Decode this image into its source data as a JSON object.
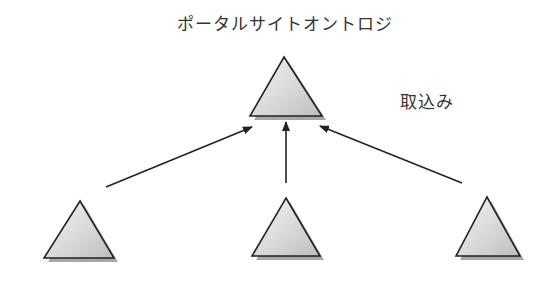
{
  "diagram": {
    "title": "ポータルサイトオントロジ",
    "edge_label": "取込み",
    "colors": {
      "stroke": "#222222",
      "fill_light": "#f2f2f2",
      "fill_dark": "#c4c4c4",
      "shadow": "#8a8a8a",
      "text": "#333333"
    },
    "nodes": [
      {
        "id": "portal-ontology",
        "label": "",
        "role": "target"
      },
      {
        "id": "source-ontology-1",
        "label": "",
        "role": "source"
      },
      {
        "id": "source-ontology-2",
        "label": "",
        "role": "source"
      },
      {
        "id": "source-ontology-3",
        "label": "",
        "role": "source"
      }
    ],
    "edges": [
      {
        "from": "source-ontology-1",
        "to": "portal-ontology"
      },
      {
        "from": "source-ontology-2",
        "to": "portal-ontology"
      },
      {
        "from": "source-ontology-3",
        "to": "portal-ontology"
      }
    ]
  }
}
